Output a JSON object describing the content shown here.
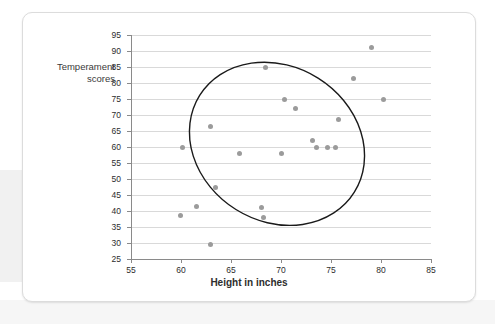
{
  "chart_data": {
    "type": "scatter",
    "title": "",
    "xlabel": "Height in inches",
    "ylabel": "Temperament scores",
    "xlim": [
      55,
      85
    ],
    "ylim": [
      25,
      95
    ],
    "xticks": [
      55,
      60,
      65,
      70,
      75,
      80,
      85
    ],
    "yticks": [
      25,
      30,
      35,
      40,
      45,
      50,
      55,
      60,
      65,
      70,
      75,
      80,
      85,
      90,
      95
    ],
    "grid": "horizontal",
    "legend": "none",
    "point_color": "#9b9b9b",
    "annotation": {
      "type": "ellipse",
      "label": "correlation oval",
      "center_x": 69.6,
      "center_y": 61,
      "width": 15.5,
      "height": 57,
      "rotation_deg": -58,
      "color": "#1a1a1a"
    },
    "points": [
      {
        "x": 59.9,
        "y": 38.5
      },
      {
        "x": 60.1,
        "y": 60.0
      },
      {
        "x": 61.5,
        "y": 41.5
      },
      {
        "x": 62.9,
        "y": 29.5
      },
      {
        "x": 62.9,
        "y": 66.5
      },
      {
        "x": 63.4,
        "y": 47.5
      },
      {
        "x": 65.8,
        "y": 58.0
      },
      {
        "x": 68.0,
        "y": 41.0
      },
      {
        "x": 68.2,
        "y": 38.0
      },
      {
        "x": 68.4,
        "y": 85.0
      },
      {
        "x": 70.0,
        "y": 58.0
      },
      {
        "x": 70.3,
        "y": 75.0
      },
      {
        "x": 71.4,
        "y": 72.0
      },
      {
        "x": 73.1,
        "y": 62.0
      },
      {
        "x": 73.5,
        "y": 60.0
      },
      {
        "x": 74.6,
        "y": 60.0
      },
      {
        "x": 75.4,
        "y": 60.0
      },
      {
        "x": 75.7,
        "y": 68.5
      },
      {
        "x": 77.2,
        "y": 81.5
      },
      {
        "x": 79.0,
        "y": 91.0
      },
      {
        "x": 80.2,
        "y": 75.0
      }
    ]
  }
}
